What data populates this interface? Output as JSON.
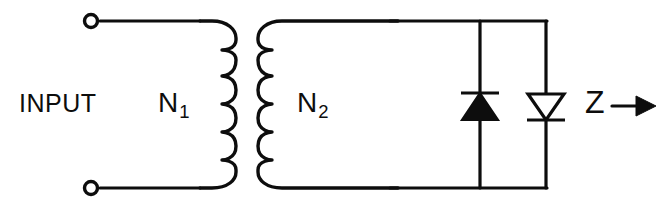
{
  "figure": {
    "type": "schematic-diagram",
    "width": 672,
    "height": 212,
    "background_color": "#ffffff",
    "line_color": "#0d0d0d"
  },
  "labels": {
    "input": "INPUT",
    "primary_turns": "N",
    "primary_turns_sub": "1",
    "secondary_turns": "N",
    "secondary_turns_sub": "2",
    "impedance": "Z"
  },
  "components": {
    "terminals": [
      {
        "name": "input-terminal-top",
        "shape": "open-circle",
        "x": 91,
        "y": 21
      },
      {
        "name": "input-terminal-bottom",
        "shape": "open-circle",
        "x": 91,
        "y": 188
      }
    ],
    "transformer": {
      "primary": {
        "label": "N1",
        "turns_drawn": 5,
        "side": "left",
        "bump_direction": "right"
      },
      "secondary": {
        "label": "N2",
        "turns_drawn": 5,
        "side": "right",
        "bump_direction": "left"
      }
    },
    "diodes": [
      {
        "name": "diode-left",
        "fill": "solid",
        "direction": "up",
        "cathode_bar": "top",
        "x": 480
      },
      {
        "name": "diode-right",
        "fill": "open",
        "direction": "down",
        "cathode_bar": "bottom",
        "x": 546
      }
    ],
    "impedance_arrow": {
      "label": "Z",
      "direction": "right",
      "x": 585,
      "y": 104
    }
  }
}
